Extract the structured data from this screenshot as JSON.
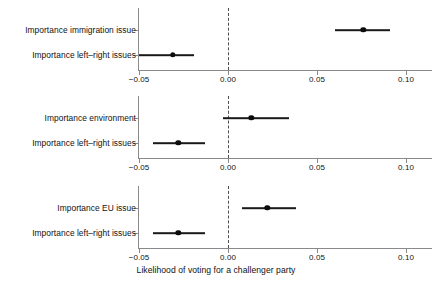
{
  "chart_data": {
    "type": "scatter",
    "title": "",
    "xlabel": "Likelihood of voting for a challenger party",
    "ylabel": "",
    "xlim": [
      -0.057,
      0.108
    ],
    "xticks": [
      -0.05,
      0.0,
      0.05,
      0.1
    ],
    "xticklabels": [
      "−0.05",
      "0.00",
      "0.05",
      "0.10"
    ],
    "grid": false,
    "legend": null,
    "reference_line": {
      "x": 0.0,
      "style": "dashed",
      "color": "#4d4d4d"
    },
    "panels": [
      {
        "id": "panel-immigration",
        "points": [
          {
            "label": "Importance immigration issue",
            "estimate": 0.076,
            "ci_low": 0.06,
            "ci_high": 0.091
          },
          {
            "label": "Importance left–right issues",
            "estimate": -0.031,
            "ci_low": -0.05,
            "ci_high": -0.019
          }
        ]
      },
      {
        "id": "panel-environment",
        "points": [
          {
            "label": "Importance environment",
            "estimate": 0.013,
            "ci_low": -0.003,
            "ci_high": 0.034
          },
          {
            "label": "Importance left–right issues",
            "estimate": -0.028,
            "ci_low": -0.042,
            "ci_high": -0.013
          }
        ]
      },
      {
        "id": "panel-eu",
        "points": [
          {
            "label": "Importance EU issue",
            "estimate": 0.022,
            "ci_low": 0.008,
            "ci_high": 0.038
          },
          {
            "label": "Importance left–right issues",
            "estimate": -0.028,
            "ci_low": -0.042,
            "ci_high": -0.013
          }
        ]
      }
    ],
    "colors": {
      "point": "#0d0d0d",
      "ci": "#1a1a1a",
      "axis": "#8a8a8a",
      "zero_line": "#4d4d4d",
      "text": "#111111",
      "background": "#ffffff"
    }
  },
  "layout": {
    "panel_tops": [
      8,
      96,
      186
    ],
    "panel_axis_y": [
      70,
      158,
      248
    ],
    "row_offsets": [
      22,
      47
    ],
    "x_title_top": 265,
    "px_per_unit": 1780,
    "x_zero_px": 228
  }
}
